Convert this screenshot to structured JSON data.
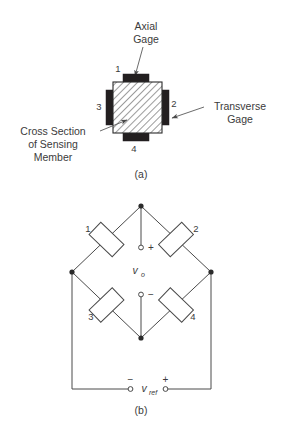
{
  "figure": {
    "panel_a": {
      "caption": "(a)",
      "axial_gage_label": [
        "Axial",
        "Gage"
      ],
      "transverse_gage_label": [
        "Transverse",
        "Gage"
      ],
      "cross_section_label": [
        "Cross Section",
        "of Sensing",
        "Member"
      ],
      "gage_numbers": {
        "top": "1",
        "right": "2",
        "left": "3",
        "bottom": "4"
      },
      "colors": {
        "gage_fill": "#231f20",
        "member_outline": "#2b2b2b",
        "hatch": "#7d7d7d"
      }
    },
    "panel_b": {
      "caption": "(b)",
      "resistor_labels": {
        "top_left": "1",
        "top_right": "2",
        "bottom_left": "3",
        "bottom_right": "4"
      },
      "output": {
        "symbol": "v",
        "subscript": "o",
        "plus": "+",
        "minus": "−"
      },
      "reference": {
        "symbol": "v",
        "subscript": "ref",
        "plus": "+",
        "minus": "−"
      },
      "colors": {
        "wire": "#4a4a4a",
        "node": "#2b2b2b"
      }
    }
  }
}
